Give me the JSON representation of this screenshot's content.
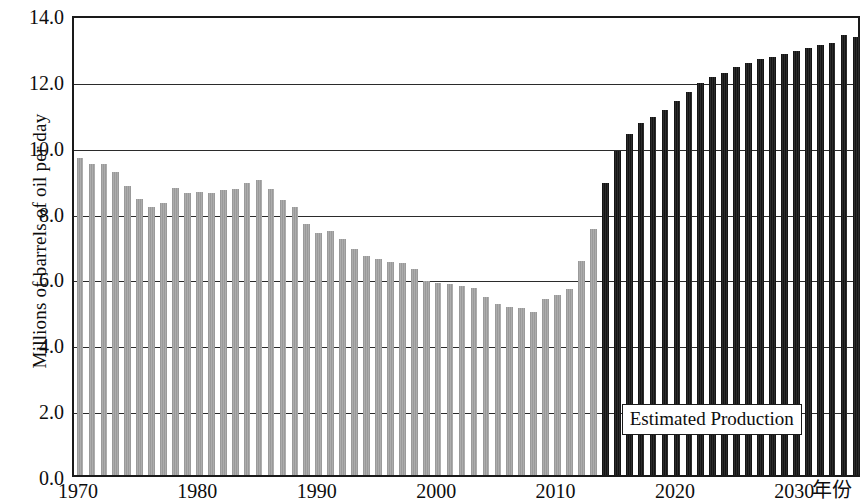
{
  "chart_data": {
    "type": "bar",
    "title": "",
    "xlabel": "年份",
    "ylabel": "Millions of barrels of oil per day",
    "ylim": [
      0.0,
      14.0
    ],
    "ytick_labels": [
      "0.0",
      "2.0",
      "4.0",
      "6.0",
      "8.0",
      "10.0",
      "12.0",
      "14.0"
    ],
    "ytick_values": [
      0.0,
      2.0,
      4.0,
      6.0,
      8.0,
      10.0,
      12.0,
      14.0
    ],
    "xtick_labels": [
      "1970",
      "1980",
      "1990",
      "2000",
      "2010",
      "2020",
      "2030"
    ],
    "xtick_values": [
      1970,
      1980,
      1990,
      2000,
      2010,
      2020,
      2030
    ],
    "xlim": [
      1969.3,
      1969.3
    ],
    "grid": true,
    "legend_position": "none",
    "annotations": [
      {
        "text": "Estimated Production",
        "x_year": 2024,
        "y_value": 3.0
      }
    ],
    "series": [
      {
        "name": "Historical Production",
        "color": "#a4a4a4",
        "kind": "historical",
        "x": [
          1970,
          1971,
          1972,
          1973,
          1974,
          1975,
          1976,
          1977,
          1978,
          1979,
          1980,
          1981,
          1982,
          1983,
          1984,
          1985,
          1986,
          1987,
          1988,
          1989,
          1990,
          1991,
          1992,
          1993,
          1994,
          1995,
          1996,
          1997,
          1998,
          1999,
          2000,
          2001,
          2002,
          2003,
          2004,
          2005,
          2006,
          2007,
          2008,
          2009,
          2010,
          2011,
          2012,
          2013
        ],
        "values": [
          9.64,
          9.45,
          9.44,
          9.21,
          8.77,
          8.38,
          8.13,
          8.25,
          8.71,
          8.55,
          8.6,
          8.57,
          8.65,
          8.69,
          8.88,
          8.97,
          8.68,
          8.35,
          8.14,
          7.61,
          7.36,
          7.42,
          7.17,
          6.85,
          6.66,
          6.56,
          6.47,
          6.45,
          6.25,
          5.88,
          5.82,
          5.8,
          5.75,
          5.68,
          5.42,
          5.18,
          5.1,
          5.06,
          4.95,
          5.36,
          5.48,
          5.65,
          6.5,
          7.47
        ]
      },
      {
        "name": "Estimated Production",
        "color": "#1c1c1c",
        "kind": "estimated",
        "x": [
          2014,
          2015,
          2016,
          2017,
          2018,
          2019,
          2020,
          2021,
          2022,
          2023,
          2024,
          2025,
          2026,
          2027,
          2028,
          2029,
          2030,
          2031,
          2032,
          2033,
          2034,
          2035
        ],
        "values": [
          8.88,
          9.85,
          10.35,
          10.68,
          10.88,
          11.08,
          11.35,
          11.62,
          11.9,
          12.08,
          12.2,
          12.4,
          12.52,
          12.62,
          12.7,
          12.78,
          12.88,
          12.98,
          13.05,
          13.12,
          13.35,
          13.3
        ]
      }
    ]
  },
  "layout": {
    "plot_left_px": 72,
    "plot_top_px": 16,
    "plot_width_px": 788,
    "plot_height_px": 461,
    "first_year": 1970,
    "last_year": 2035
  }
}
